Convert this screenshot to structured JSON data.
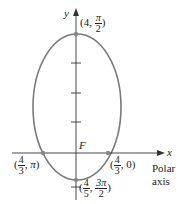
{
  "axes": {
    "x_label": "x",
    "y_label": "y",
    "polar_axis_label": [
      "Polar",
      "axis"
    ]
  },
  "focus_label": "F",
  "points": {
    "top": {
      "r_num": "4",
      "theta_num": "π",
      "theta_den": "2"
    },
    "right": {
      "r_num": "4",
      "r_den": "3",
      "theta": "0"
    },
    "left": {
      "r_num": "4",
      "r_den": "3",
      "theta": "π"
    },
    "bottom": {
      "r_num": "4",
      "r_den": "5",
      "theta_num": "3π",
      "theta_den": "2"
    }
  },
  "colors": {
    "curve": "#7a7a7a",
    "axis": "#333333"
  }
}
